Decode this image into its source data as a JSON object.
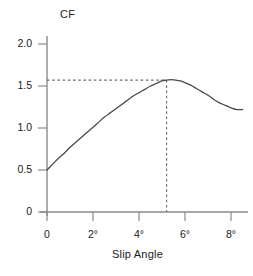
{
  "chart_data": {
    "type": "line",
    "title": "",
    "subtitle": "",
    "xlabel": "Slip Angle",
    "ylabel": "CF",
    "xlim": [
      0,
      8.7
    ],
    "ylim": [
      0,
      2.15
    ],
    "grid": false,
    "legend": null,
    "x_tick_labels": [
      "0",
      "2°",
      "4°",
      "6°",
      "8°"
    ],
    "x_tick_values": [
      0,
      2,
      4,
      6,
      8
    ],
    "y_tick_labels": [
      "0",
      "0.5",
      "1.0",
      "1.5",
      "2.0"
    ],
    "y_tick_values": [
      0,
      0.5,
      1.0,
      1.5,
      2.0
    ],
    "series": [
      {
        "name": "Cornering force coefficient",
        "x": [
          0.0,
          0.25,
          0.5,
          0.75,
          1.0,
          1.25,
          1.5,
          1.75,
          2.0,
          2.25,
          2.5,
          2.75,
          3.0,
          3.25,
          3.5,
          3.75,
          4.0,
          4.25,
          4.5,
          4.75,
          5.0,
          5.2,
          5.4,
          5.6,
          5.8,
          6.0,
          6.25,
          6.5,
          6.75,
          7.0,
          7.25,
          7.5,
          7.75,
          8.0,
          8.25,
          8.5
        ],
        "y": [
          0.5,
          0.57,
          0.64,
          0.7,
          0.77,
          0.83,
          0.89,
          0.95,
          1.01,
          1.07,
          1.13,
          1.18,
          1.23,
          1.28,
          1.33,
          1.38,
          1.42,
          1.46,
          1.5,
          1.53,
          1.56,
          1.57,
          1.575,
          1.57,
          1.56,
          1.54,
          1.51,
          1.47,
          1.43,
          1.39,
          1.34,
          1.3,
          1.27,
          1.24,
          1.22,
          1.22
        ]
      }
    ],
    "annotations": [
      {
        "name": "peak-marker",
        "type": "dashed-crosshair",
        "x": 5.2,
        "y": 1.57,
        "horizontal_from_x": 0,
        "vertical_from_y": 0
      }
    ]
  },
  "labels": {
    "y_axis_title": "CF",
    "x_axis_title": "Slip Angle",
    "y_ticks": [
      "2.0",
      "1.5",
      "1.0",
      "0.5",
      "0"
    ],
    "x_ticks": [
      "0",
      "2°",
      "4°",
      "6°",
      "8°"
    ]
  },
  "colors": {
    "background": "#ffffff",
    "axis": "#8a8a8a",
    "curve": "#4a4a4a",
    "dashed": "#6b6b6b",
    "text": "#1a1a1a"
  }
}
